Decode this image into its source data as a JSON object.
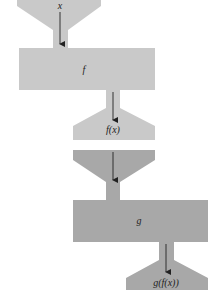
{
  "diagram": {
    "colors": {
      "light_gray": "#c9c9c9",
      "dark_gray": "#a8a8a8",
      "arrow": "#222222",
      "background": "#ffffff"
    },
    "machine_f": {
      "input_label": "x",
      "function_label": "f",
      "output_label": "f(x)"
    },
    "machine_g": {
      "function_label": "g",
      "output_label": "g(f(x))"
    }
  }
}
